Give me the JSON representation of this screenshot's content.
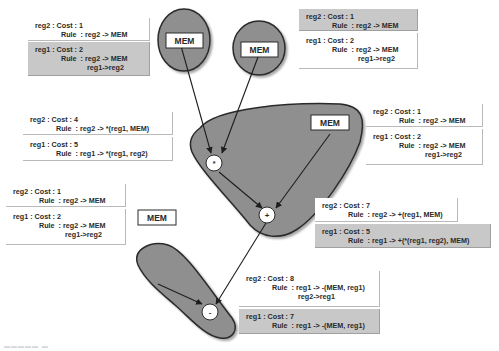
{
  "diagram": {
    "colors": {
      "region_fill": "#8f8f8f",
      "region_stroke": "#2b2b2b",
      "box_white": "#ffffff",
      "box_grey": "#c8c8c8",
      "edge": "#1e1e1e"
    },
    "nodes": {
      "mem1": {
        "label": "MEM"
      },
      "mem2": {
        "label": "MEM"
      },
      "mem3": {
        "label": "MEM"
      },
      "mem4": {
        "label": "MEM"
      },
      "mul": {
        "label": "*"
      },
      "plus": {
        "label": "+"
      },
      "minus": {
        "label": "-"
      }
    },
    "boxes": {
      "mem1_reg2": {
        "line1": "reg2 : Cost : 1",
        "line2": "Rule  : reg2 -> MEM"
      },
      "mem1_reg1": {
        "line1": "reg1 : Cost : 2",
        "line2": "Rule  : reg2 -> MEM",
        "line3": "reg1->reg2"
      },
      "mem2_reg2": {
        "line1": "reg2 : Cost : 1",
        "line2": "Rule  : reg2 -> MEM"
      },
      "mem2_reg1": {
        "line1": "reg1 : Cost : 2",
        "line2": "Rule  : reg2 -> MEM",
        "line3": "reg1->reg2"
      },
      "mul_reg2": {
        "line1": "reg2 : Cost : 4",
        "line2": "Rule  : reg2 -> *(reg1, MEM)"
      },
      "mul_reg1": {
        "line1": "reg1 : Cost : 5",
        "line2": "Rule  : reg1 -> *(reg1, reg2)"
      },
      "mem3_reg2": {
        "line1": "reg2 : Cost : 1",
        "line2": "Rule  : reg2 -> MEM"
      },
      "mem3_reg1": {
        "line1": "reg1 : Cost : 2",
        "line2": "Rule  : reg2 -> MEM",
        "line3": "reg1->reg2"
      },
      "mem4_reg2": {
        "line1": "reg2 : Cost : 1",
        "line2": "Rule  : reg2 -> MEM"
      },
      "mem4_reg1": {
        "line1": "reg1 : Cost : 2",
        "line2": "Rule  : reg2 -> MEM",
        "line3": "reg1->reg2"
      },
      "plus_reg2": {
        "line1": "reg2 : Cost : 7",
        "line2": "Rule  : reg2 -> +(reg1, MEM)"
      },
      "plus_reg1": {
        "line1": "reg1 : Cost : 5",
        "line2": "Rule  : reg1 -> +(*(reg1, reg2), MEM)"
      },
      "minus_reg2": {
        "line1": "reg2 : Cost : 8",
        "line2": "Rule  : reg1 -> -(MEM, reg1)",
        "line3": "reg2->reg1"
      },
      "minus_reg1": {
        "line1": "reg1 : Cost : 7",
        "line2": "Rule  : reg1 -> -(MEM, reg1)"
      }
    }
  }
}
